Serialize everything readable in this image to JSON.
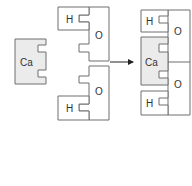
{
  "diagram": {
    "colors": {
      "stroke": "#6f6f6f",
      "calcium_fill": "#ebebeb",
      "piece_fill": "#ffffff",
      "arrow": "#222222"
    },
    "left": {
      "calcium_label": "Ca"
    },
    "middle": {
      "top_pair": {
        "h_label": "H",
        "o_label": "O"
      },
      "bottom_pair": {
        "h_label": "H",
        "o_label": "O"
      }
    },
    "right": {
      "top_h_label": "H",
      "top_o_label": "O",
      "calcium_label": "Ca",
      "bottom_o_label": "O",
      "bottom_h_label": "H"
    },
    "arrow": {
      "direction": "right"
    }
  }
}
